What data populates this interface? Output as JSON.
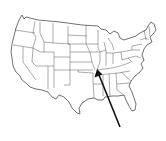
{
  "map": {
    "subject": "United States (contiguous) outline map with state boundaries",
    "background_color": "#ffffff",
    "line_color": "#333333",
    "arrow": {
      "color": "#111111",
      "tail": [
        120,
        127
      ],
      "tip": [
        97,
        70
      ],
      "points_to": "Missouri / southern Illinois region"
    }
  }
}
